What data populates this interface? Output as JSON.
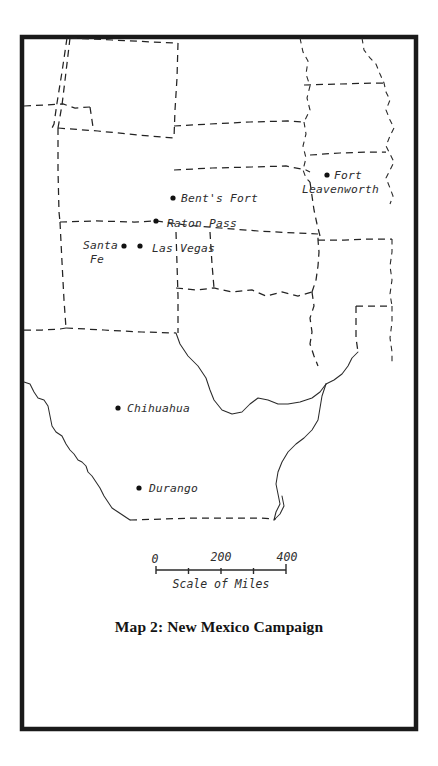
{
  "figure": {
    "title": "Map 2: New Mexico Campaign",
    "frame_color": "#1a1a1a",
    "background_color": "#ffffff",
    "line_color": "#2a2a2a"
  },
  "scale_bar": {
    "caption": "Scale of Miles",
    "unit": "miles",
    "labels": [
      "0",
      "200",
      "400"
    ],
    "tick_values": [
      0,
      100,
      200,
      300,
      400
    ],
    "label_0": "0",
    "label_200": "200",
    "label_400": "400"
  },
  "cities": [
    {
      "name": "Bent's Fort",
      "label": "Bent's Fort",
      "dot_x": 173,
      "dot_y": 198,
      "label_x": 181,
      "label_y": 202,
      "anchor": "start"
    },
    {
      "name": "Fort Leavenworth",
      "label_line1": "Fort",
      "label_line2": "Leavenworth",
      "dot_x": 327,
      "dot_y": 175,
      "label_x": 334,
      "label_y": 179,
      "label2_x": 302,
      "label2_y": 193,
      "anchor": "start"
    },
    {
      "name": "Raton Pass",
      "label": "Raton Pass",
      "dot_x": 156,
      "dot_y": 221,
      "label_x": 167,
      "label_y": 227,
      "anchor": "start"
    },
    {
      "name": "Santa Fe",
      "label_line1": "Santa",
      "label_line2": "Fe",
      "dot_x": 124,
      "dot_y": 246,
      "label_x": 118,
      "label_y": 248,
      "label2_x": 104,
      "label2_y": 262,
      "anchor": "end"
    },
    {
      "name": "Las Vegas",
      "label": "Las Vegas",
      "dot_x": 140,
      "dot_y": 246,
      "label_x": 152,
      "label_y": 252,
      "anchor": "start"
    },
    {
      "name": "Chihuahua",
      "label": "Chihuahua",
      "dot_x": 118,
      "dot_y": 408,
      "label_x": 127,
      "label_y": 411,
      "anchor": "start"
    },
    {
      "name": "Durango",
      "label": "Durango",
      "dot_x": 139,
      "dot_y": 488,
      "label_x": 149,
      "label_y": 491,
      "anchor": "start"
    }
  ]
}
